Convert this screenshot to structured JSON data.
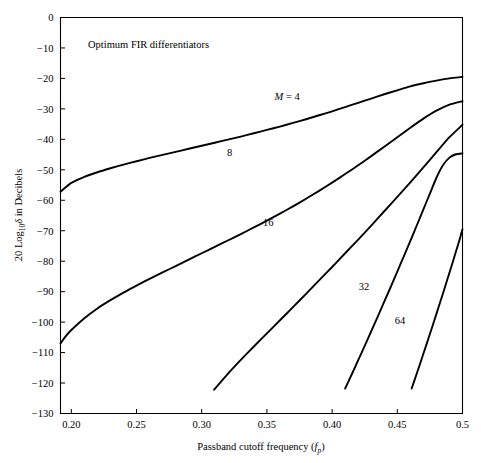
{
  "chart_data": {
    "type": "line",
    "title": "",
    "annotation": "Optimum FIR differentiators",
    "xlabel_main": "Passband cutoff frequency (",
    "xlabel_var": "f",
    "xlabel_sub": "p",
    "xlabel_close": ")",
    "xlabel_full": "Passband cutoff frequency (fp)",
    "ylabel_prefix": "20 Log",
    "ylabel_sub": "10",
    "ylabel_delta": "δ",
    "ylabel_suffix": " in Decibels",
    "ylabel_full": "20 Log10δ in Decibels",
    "xlim": [
      0.1917,
      0.5
    ],
    "ylim": [
      -130,
      0
    ],
    "xticks": [
      0.2,
      0.25,
      0.3,
      0.35,
      0.4,
      0.45,
      0.5
    ],
    "xtick_labels": [
      "0.20",
      "0.25",
      "0.30",
      "0.35",
      "0.40",
      "0.45",
      "0.5"
    ],
    "yticks": [
      0,
      -10,
      -20,
      -30,
      -40,
      -50,
      -60,
      -70,
      -80,
      -90,
      -100,
      -110,
      -120,
      -130
    ],
    "ytick_labels": [
      "0",
      "−10",
      "−20",
      "−30",
      "−40",
      "−50",
      "−60",
      "−70",
      "−80",
      "−90",
      "−100",
      "−110",
      "−120",
      "−130"
    ],
    "grid": false,
    "legend": "inline-labels",
    "line_color": "#000000",
    "series": [
      {
        "name": "M = 4",
        "label": "M = 4",
        "label_italic_prefix": "M",
        "label_rest": " = 4",
        "label_x": 0.3655,
        "label_y": -27.0,
        "points": [
          [
            0.1917,
            -57.2
          ],
          [
            0.195,
            -56.0
          ],
          [
            0.2,
            -54.3
          ],
          [
            0.21,
            -52.3
          ],
          [
            0.22,
            -50.8
          ],
          [
            0.23,
            -49.5
          ],
          [
            0.24,
            -48.3
          ],
          [
            0.25,
            -47.2
          ],
          [
            0.26,
            -46.1
          ],
          [
            0.27,
            -45.1
          ],
          [
            0.28,
            -44.1
          ],
          [
            0.29,
            -43.1
          ],
          [
            0.3,
            -42.1
          ],
          [
            0.31,
            -41.1
          ],
          [
            0.32,
            -40.1
          ],
          [
            0.33,
            -39.1
          ],
          [
            0.34,
            -38.0
          ],
          [
            0.35,
            -36.9
          ],
          [
            0.36,
            -35.8
          ],
          [
            0.37,
            -34.6
          ],
          [
            0.38,
            -33.4
          ],
          [
            0.39,
            -32.1
          ],
          [
            0.4,
            -30.8
          ],
          [
            0.41,
            -29.4
          ],
          [
            0.42,
            -28.0
          ],
          [
            0.43,
            -26.6
          ],
          [
            0.44,
            -25.2
          ],
          [
            0.45,
            -23.9
          ],
          [
            0.46,
            -22.6
          ],
          [
            0.47,
            -21.6
          ],
          [
            0.48,
            -20.7
          ],
          [
            0.49,
            -20.0
          ],
          [
            0.5,
            -19.5
          ]
        ]
      },
      {
        "name": "8",
        "label": "8",
        "label_x": 0.3215,
        "label_y": -45.5,
        "points": [
          [
            0.1917,
            -107.0
          ],
          [
            0.195,
            -105.0
          ],
          [
            0.2,
            -102.6
          ],
          [
            0.21,
            -98.7
          ],
          [
            0.22,
            -95.5
          ],
          [
            0.23,
            -92.8
          ],
          [
            0.24,
            -90.3
          ],
          [
            0.25,
            -88.0
          ],
          [
            0.26,
            -85.8
          ],
          [
            0.27,
            -83.7
          ],
          [
            0.28,
            -81.6
          ],
          [
            0.29,
            -79.5
          ],
          [
            0.3,
            -77.4
          ],
          [
            0.31,
            -75.3
          ],
          [
            0.32,
            -73.2
          ],
          [
            0.33,
            -71.1
          ],
          [
            0.34,
            -68.9
          ],
          [
            0.35,
            -66.7
          ],
          [
            0.36,
            -64.4
          ],
          [
            0.37,
            -62.0
          ],
          [
            0.38,
            -59.5
          ],
          [
            0.39,
            -56.9
          ],
          [
            0.4,
            -54.2
          ],
          [
            0.41,
            -51.4
          ],
          [
            0.42,
            -48.5
          ],
          [
            0.43,
            -45.5
          ],
          [
            0.44,
            -42.4
          ],
          [
            0.45,
            -39.3
          ],
          [
            0.46,
            -36.2
          ],
          [
            0.47,
            -33.2
          ],
          [
            0.48,
            -30.6
          ],
          [
            0.49,
            -28.6
          ],
          [
            0.5,
            -27.5
          ]
        ]
      },
      {
        "name": "16",
        "label": "16",
        "label_x": 0.351,
        "label_y": -68.5,
        "points": [
          [
            0.3095,
            -122.2
          ],
          [
            0.32,
            -117.0
          ],
          [
            0.33,
            -112.4
          ],
          [
            0.34,
            -108.0
          ],
          [
            0.35,
            -103.7
          ],
          [
            0.36,
            -99.4
          ],
          [
            0.37,
            -95.1
          ],
          [
            0.38,
            -90.7
          ],
          [
            0.39,
            -86.3
          ],
          [
            0.4,
            -81.9
          ],
          [
            0.41,
            -77.4
          ],
          [
            0.42,
            -72.9
          ],
          [
            0.43,
            -68.3
          ],
          [
            0.44,
            -63.6
          ],
          [
            0.45,
            -58.9
          ],
          [
            0.46,
            -54.1
          ],
          [
            0.47,
            -49.2
          ],
          [
            0.48,
            -44.2
          ],
          [
            0.49,
            -39.3
          ],
          [
            0.5,
            -35.2
          ]
        ]
      },
      {
        "name": "32",
        "label": "32",
        "label_x": 0.4245,
        "label_y": -89.5,
        "points": [
          [
            0.41,
            -121.8
          ],
          [
            0.415,
            -117.2
          ],
          [
            0.42,
            -112.5
          ],
          [
            0.425,
            -107.8
          ],
          [
            0.43,
            -103.0
          ],
          [
            0.435,
            -98.2
          ],
          [
            0.44,
            -93.3
          ],
          [
            0.445,
            -88.4
          ],
          [
            0.45,
            -83.4
          ],
          [
            0.455,
            -78.4
          ],
          [
            0.46,
            -73.3
          ],
          [
            0.465,
            -68.2
          ],
          [
            0.47,
            -63.0
          ],
          [
            0.475,
            -57.8
          ],
          [
            0.48,
            -52.6
          ],
          [
            0.485,
            -48.5
          ],
          [
            0.49,
            -46.0
          ],
          [
            0.495,
            -44.9
          ],
          [
            0.5,
            -44.6
          ]
        ]
      },
      {
        "name": "64",
        "label": "64",
        "label_x": 0.452,
        "label_y": -100.5,
        "points": [
          [
            0.461,
            -121.8
          ],
          [
            0.465,
            -116.8
          ],
          [
            0.47,
            -110.4
          ],
          [
            0.475,
            -103.9
          ],
          [
            0.48,
            -97.3
          ],
          [
            0.485,
            -90.6
          ],
          [
            0.488,
            -86.5
          ],
          [
            0.491,
            -82.4
          ],
          [
            0.494,
            -78.2
          ],
          [
            0.496,
            -75.4
          ],
          [
            0.498,
            -72.6
          ],
          [
            0.499,
            -71.0
          ],
          [
            0.5,
            -69.5
          ]
        ]
      }
    ]
  }
}
